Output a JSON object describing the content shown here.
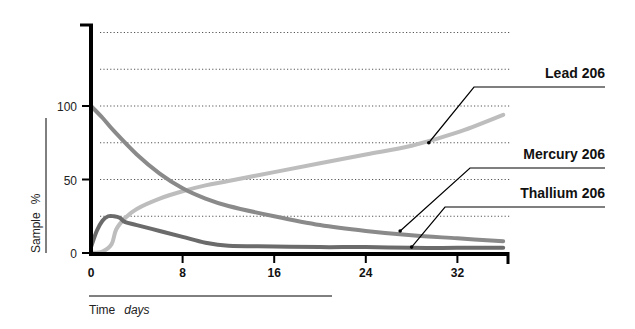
{
  "chart_data": {
    "type": "line",
    "title": "",
    "xlabel": "Time",
    "xunit": "days",
    "ylabel": "Sample",
    "yunit": "%",
    "xlim": [
      0,
      36
    ],
    "ylim": [
      0,
      155
    ],
    "xticks": [
      0,
      8,
      16,
      24,
      32
    ],
    "yticks": [
      0,
      50,
      100
    ],
    "gridlines_y": [
      25,
      50,
      75,
      100,
      125,
      150
    ],
    "grid": "horizontal-dotted",
    "legend_placement": "right (callout labels)",
    "series": [
      {
        "name": "Lead 206",
        "color": "#bdbdbd",
        "x": [
          0,
          1,
          1.8,
          2.2,
          3,
          4,
          6,
          8,
          10,
          12,
          16,
          20,
          24,
          28,
          32,
          36
        ],
        "y": [
          0,
          1,
          6,
          16,
          24,
          30,
          37,
          42,
          46,
          49,
          55,
          61,
          67,
          73,
          82,
          94
        ],
        "label_anchor": {
          "x": 29.5,
          "y": 75
        }
      },
      {
        "name": "Mercury 206",
        "color": "#8a8a8a",
        "x": [
          0,
          1,
          2,
          4,
          6,
          8,
          10,
          12,
          16,
          20,
          24,
          28,
          32,
          36
        ],
        "y": [
          100,
          92,
          83,
          67,
          54,
          44,
          37,
          32,
          25,
          19,
          15,
          12,
          10,
          8
        ],
        "label_anchor": {
          "x": 27,
          "y": 15
        }
      },
      {
        "name": "Thallium 206",
        "color": "#6b6b6b",
        "x": [
          0,
          0.5,
          1,
          1.5,
          2,
          2.5,
          3,
          4,
          6,
          8,
          10,
          12,
          16,
          20,
          24,
          28,
          32,
          36
        ],
        "y": [
          4,
          15,
          22,
          25,
          25,
          24,
          21,
          19,
          15,
          11,
          7,
          5,
          4.5,
          4,
          4,
          3.5,
          3.5,
          3.5
        ],
        "label_anchor": {
          "x": 28,
          "y": 4
        }
      }
    ]
  }
}
